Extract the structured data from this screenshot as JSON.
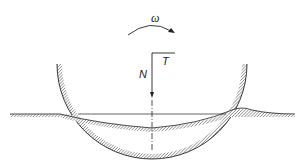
{
  "diagram": {
    "labels": {
      "angular_velocity": "ω",
      "normal_force": "N",
      "tangential_force": "T"
    },
    "colors": {
      "stroke": "#222222",
      "hatch": "#555555",
      "background": "#ffffff"
    }
  }
}
